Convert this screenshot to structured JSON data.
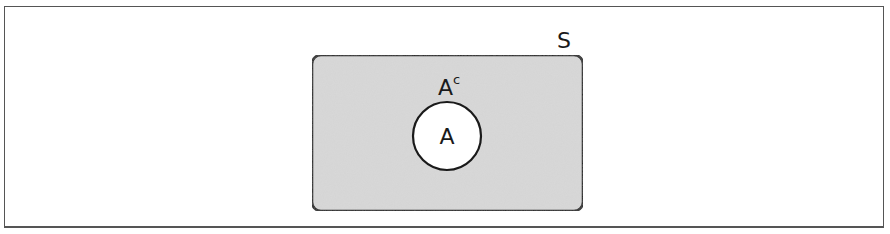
{
  "diagram": {
    "type": "venn",
    "universe": {
      "label": "S",
      "fill": "#d9d9d9",
      "stroke": "#1a1a1a"
    },
    "set": {
      "label": "A",
      "fill": "#ffffff",
      "stroke": "#1a1a1a"
    },
    "complement": {
      "label_base": "A",
      "label_sup": "c"
    }
  }
}
